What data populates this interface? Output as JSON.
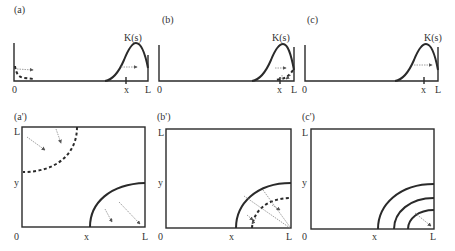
{
  "figure": {
    "panels_top": [
      {
        "id": "a",
        "label": "(a)",
        "curve_label": "K(s)",
        "origin_label": "0",
        "x_label": "x",
        "end_label": "L"
      },
      {
        "id": "b",
        "label": "(b)",
        "curve_label": "K(s)",
        "origin_label": "0",
        "x_label": "x",
        "end_label": "L"
      },
      {
        "id": "c",
        "label": "(c)",
        "curve_label": "K(s)",
        "origin_label": "0",
        "x_label": "x",
        "end_label": "L"
      }
    ],
    "panels_bottom": [
      {
        "id": "a-prime",
        "label": "(a')",
        "origin_label": "0",
        "x_label": "x",
        "end_label": "L",
        "y_label": "y",
        "top_label": "L"
      },
      {
        "id": "b-prime",
        "label": "(b')",
        "origin_label": "0",
        "x_label": "x",
        "end_label": "L",
        "y_label": "y",
        "top_label": "L"
      },
      {
        "id": "c-prime",
        "label": "(c')",
        "origin_label": "0",
        "x_label": "x",
        "end_label": "L",
        "y_label": "y",
        "top_label": "L"
      }
    ]
  },
  "colors": {
    "line": "#2a2a2a",
    "arrow": "#888888",
    "background": "#ffffff"
  }
}
